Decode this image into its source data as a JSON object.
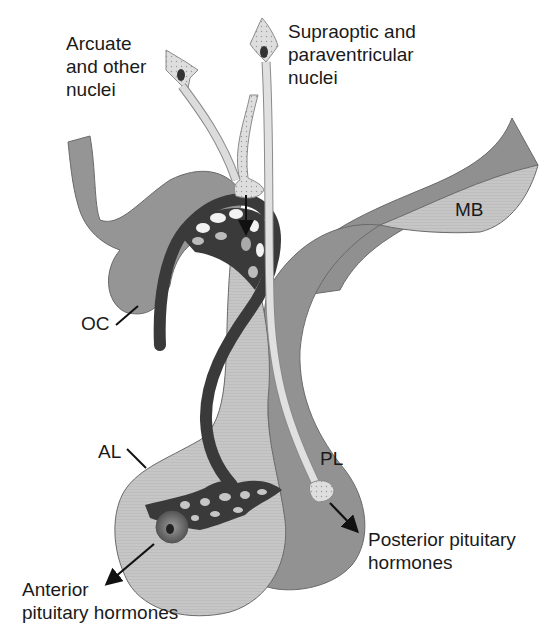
{
  "diagram": {
    "labels": {
      "arcuate": "Arcuate\nand other\nnuclei",
      "supraoptic": "Supraoptic and\nparaventricular\nnuclei",
      "mb": "MB",
      "oc": "OC",
      "al": "AL",
      "pl": "PL",
      "anterior": "Anterior\npituitary hormones",
      "posterior": "Posterior pituitary\nhormones"
    },
    "colors": {
      "background": "#ffffff",
      "dark_tissue": "#8e8e8e",
      "mid_tissue": "#a8a8a8",
      "light_tissue": "#c9c9c9",
      "neuron": "#dcdcdc",
      "vessel": "#3a3a3a",
      "text": "#1a1a1a"
    }
  }
}
